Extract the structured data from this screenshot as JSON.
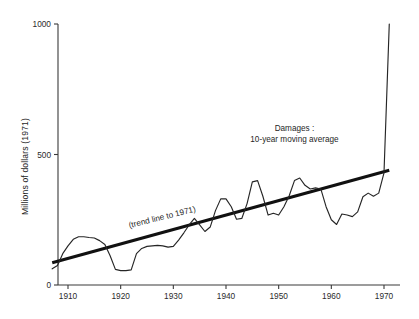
{
  "chart_data": {
    "type": "line",
    "title": "",
    "xlabel": "",
    "ylabel": "Millions of dollars (1971)",
    "xlim": [
      1907,
      1971
    ],
    "ylim": [
      0,
      1000
    ],
    "grid": false,
    "legend_position": "none",
    "y_ticks": [
      0,
      500,
      1000
    ],
    "y_tick_labels": [
      "0",
      "500",
      "1000"
    ],
    "x_ticks": [
      1910,
      1920,
      1930,
      1940,
      1950,
      1960,
      1970
    ],
    "x_tick_labels": [
      "1910",
      "1920",
      "1930",
      "1940",
      "1950",
      "1960",
      "1970"
    ],
    "annotations": [
      {
        "name": "damages-annotation",
        "line1": "Damages :",
        "line2": "10-year moving average",
        "x": 1953,
        "y": 590
      },
      {
        "name": "trend-line-annotation",
        "text": "(trend line to 1971)",
        "x": 1928,
        "y": 250,
        "rotation": -14
      }
    ],
    "series": [
      {
        "name": "Damages: 10-year moving average",
        "style": "thin-jagged",
        "x": [
          1907,
          1908,
          1909,
          1910,
          1911,
          1912,
          1913,
          1914,
          1915,
          1916,
          1917,
          1918,
          1919,
          1920,
          1921,
          1922,
          1923,
          1924,
          1925,
          1926,
          1927,
          1928,
          1929,
          1930,
          1931,
          1932,
          1933,
          1934,
          1935,
          1936,
          1937,
          1938,
          1939,
          1940,
          1941,
          1942,
          1943,
          1944,
          1945,
          1946,
          1947,
          1948,
          1949,
          1950,
          1951,
          1952,
          1953,
          1954,
          1955,
          1956,
          1957,
          1958,
          1959,
          1960,
          1961,
          1962,
          1963,
          1964,
          1965,
          1966,
          1967,
          1968,
          1969,
          1970,
          1971
        ],
        "values": [
          62,
          75,
          120,
          150,
          175,
          185,
          185,
          182,
          180,
          170,
          155,
          112,
          60,
          55,
          55,
          58,
          120,
          140,
          148,
          150,
          152,
          150,
          145,
          148,
          172,
          200,
          230,
          255,
          230,
          205,
          222,
          285,
          330,
          330,
          300,
          252,
          255,
          312,
          395,
          400,
          340,
          268,
          275,
          268,
          300,
          342,
          400,
          410,
          382,
          368,
          372,
          368,
          300,
          250,
          232,
          272,
          268,
          262,
          280,
          338,
          352,
          340,
          352,
          430,
          1000
        ]
      },
      {
        "name": "Trend line to 1971",
        "style": "thick-straight",
        "x": [
          1907,
          1971
        ],
        "values": [
          85,
          440
        ]
      }
    ]
  },
  "axis": {
    "y_title": "Millions of dollars (1971)"
  }
}
